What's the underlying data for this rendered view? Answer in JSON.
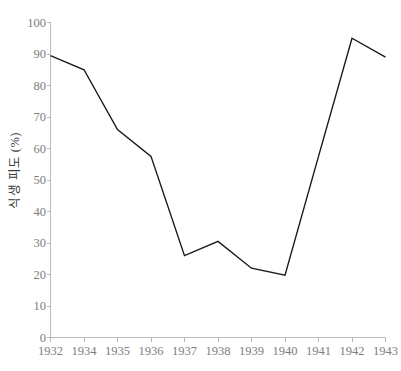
{
  "chart_data": {
    "type": "line",
    "title": "",
    "subtitle": "",
    "xlabel": "",
    "ylabel": "식생 피도 (%)",
    "categories": [
      "1932",
      "1934",
      "1935",
      "1936",
      "1937",
      "1938",
      "1939",
      "1940",
      "1941",
      "1942",
      "1943"
    ],
    "values": [
      89.5,
      85,
      66,
      57.5,
      26,
      30.5,
      22,
      19.8,
      57.5,
      95,
      89
    ],
    "series": [
      {
        "name": "식생 피도",
        "values": [
          89.5,
          85,
          66,
          57.5,
          26,
          30.5,
          22,
          19.8,
          57.5,
          95,
          89
        ]
      }
    ],
    "ylim": [
      0,
      100
    ],
    "ytick_values": [
      0,
      10,
      20,
      30,
      40,
      50,
      60,
      70,
      80,
      90,
      100
    ],
    "ytick_labels": [
      "0",
      "10",
      "20",
      "30",
      "40",
      "50",
      "60",
      "70",
      "80",
      "90",
      "100"
    ],
    "xtick_labels": [
      "1932",
      "1934",
      "1935",
      "1936",
      "1937",
      "1938",
      "1939",
      "1940",
      "1941",
      "1942",
      "1943"
    ],
    "grid": false,
    "legend": false,
    "legend_position": "none",
    "line_color": "#1a1a1a",
    "axis_color": "#b9b9b9",
    "tick_label_color": "#7d7d7d",
    "axis_title_color": "#3b3b3b",
    "background_color": "#ffffff",
    "annotations": []
  }
}
